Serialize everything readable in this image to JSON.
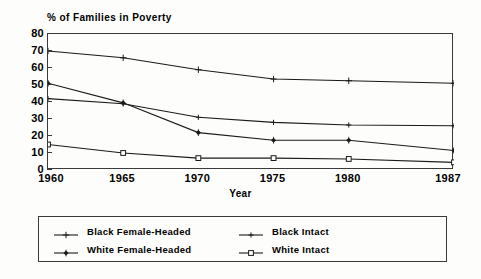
{
  "chart_data": {
    "type": "line",
    "title": "% of Families in Poverty",
    "xlabel": "Year",
    "ylabel": "",
    "x": [
      1960,
      1965,
      1970,
      1975,
      1980,
      1987
    ],
    "categories": [
      "1960",
      "1965",
      "1970",
      "1975",
      "1980",
      "1987"
    ],
    "xlim": [
      1960,
      1987
    ],
    "ylim": [
      0,
      80
    ],
    "ytick_labels": [
      "0",
      "10",
      "20",
      "30",
      "40",
      "50",
      "60",
      "70",
      "80"
    ],
    "yticks": [
      0,
      10,
      20,
      30,
      40,
      50,
      60,
      70,
      80
    ],
    "grid": false,
    "legend_position": "below-plot",
    "series": [
      {
        "name": "Black Female-Headed",
        "marker": "plus",
        "color": "#1a1a1a",
        "values": [
          70,
          66,
          59,
          53.5,
          52.5,
          51
        ]
      },
      {
        "name": "Black Intact",
        "marker": "plus-small",
        "color": "#1a1a1a",
        "values": [
          42,
          39,
          31,
          28,
          26.5,
          26
        ]
      },
      {
        "name": "White Female-Headed",
        "marker": "filled-diamond",
        "color": "#1a1a1a",
        "values": [
          51,
          39.5,
          22,
          17.5,
          17.5,
          11.5
        ]
      },
      {
        "name": "White Intact",
        "marker": "open-square",
        "color": "#1a1a1a",
        "values": [
          15,
          10,
          7,
          7,
          6.5,
          4.5
        ]
      }
    ]
  },
  "axis": {
    "x_title": "Year"
  },
  "legend": {
    "items": [
      {
        "label": "Black Female-Headed"
      },
      {
        "label": "Black Intact"
      },
      {
        "label": "White Female-Headed"
      },
      {
        "label": "White Intact"
      }
    ]
  },
  "colors": {
    "line": "#1a1a1a",
    "frame": "#3a3a3a",
    "background": "#fdfdfb"
  }
}
